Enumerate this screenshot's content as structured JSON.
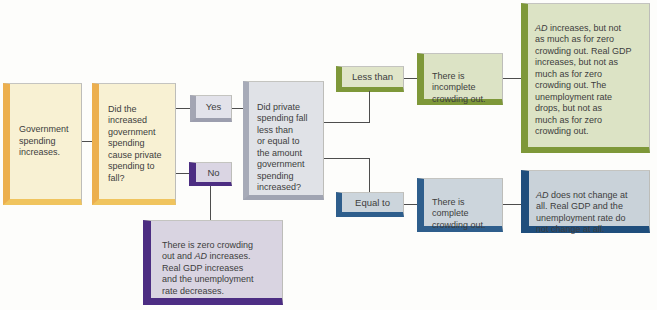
{
  "figure": {
    "type": "decision-flowchart",
    "topic": "Government spending increases and crowding out",
    "background": "#fdfdfb",
    "text_color": "#3d3d3d",
    "connector_color": "#4d4d4d",
    "palette": {
      "yellow_accent": "#ecaf4e",
      "yellow_fill": "#f8f1d3",
      "gray_accent": "#a7abb8",
      "gray_fill": "#e0e2e7",
      "purple_accent": "#4c2d82",
      "purple_fill": "#d9d4e1",
      "green_accent": "#7e9839",
      "green_fill": "#dce3c5",
      "blue_accent": "#2e5e8c",
      "blue_fill": "#ccd5dc",
      "navy_accent": "#1f4e7c",
      "navy_fill": "#c9d2d9"
    },
    "nodes": {
      "start": {
        "text": "Government\nspending\nincreases."
      },
      "q_private_fall": {
        "text": "Did the\nincreased\ngovernment\nspending\ncause private\nspending to\nfall?"
      },
      "branch_yes": {
        "label": "Yes"
      },
      "branch_no": {
        "label": "No"
      },
      "q_less_or_equal": {
        "text": "Did private\nspending fall\nless than\nor equal to\nthe amount\ngovernment\nspending\nincreased?"
      },
      "outcome_no": {
        "html": "There is zero crowding\nout and <i>AD</i> increases.\nReal GDP increases\nand the unemployment\nrate decreases."
      },
      "branch_less_than": {
        "label": "Less than"
      },
      "outcome_incomplete": {
        "text": "There is\nincomplete\ncrowding out."
      },
      "detail_incomplete": {
        "html": "<i>AD</i> increases, but not\nas much as for zero\ncrowding out. Real GDP\nincreases, but not as\nmuch as for zero\ncrowding out. The\nunemployment rate\ndrops, but not as\nmuch as for zero\ncrowding out."
      },
      "branch_equal_to": {
        "label": "Equal to"
      },
      "outcome_complete": {
        "text": "There is\ncomplete\ncrowding out."
      },
      "detail_complete": {
        "html": "<i>AD</i> does not change at\nall. Real GDP and the\nunemployment rate do\nnot change at all."
      }
    }
  }
}
